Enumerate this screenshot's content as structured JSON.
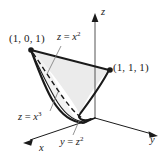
{
  "figure": {
    "background_color": "#ffffff",
    "stroke_color": "#1a1a1a",
    "surface_fill_color": "#ebebeb",
    "axes": {
      "x_label": "x",
      "y_label": "y",
      "z_label": "z"
    },
    "points": [
      {
        "name": "point-1-0-1",
        "label": "(1, 0, 1)"
      },
      {
        "name": "point-1-1-1",
        "label": "(1, 1, 1)"
      }
    ],
    "curve_labels": {
      "upper": {
        "var": "z",
        "op": " = ",
        "base": "x",
        "exp": "2"
      },
      "lower": {
        "var": "z",
        "op": " = ",
        "base": "x",
        "exp": "3"
      },
      "floor": {
        "var": "y",
        "op": " = ",
        "base": "z",
        "exp": "2"
      }
    }
  }
}
